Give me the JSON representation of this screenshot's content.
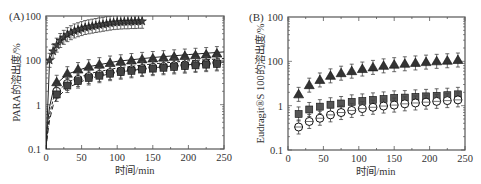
{
  "chart_data": [
    {
      "panel": "(A)",
      "type": "scatter",
      "title": "",
      "xlabel": "时间/min",
      "ylabel": "PARA的溶出度/%",
      "xlim": [
        0,
        250
      ],
      "ylim": [
        0.1,
        100
      ],
      "yscale": "log",
      "xticks": [
        0,
        50,
        100,
        150,
        200,
        250
      ],
      "xtick_labels": [
        "0",
        "50",
        "100",
        "150",
        "200",
        "250"
      ],
      "yticks": [
        0.1,
        1,
        10,
        100
      ],
      "ytick_labels": [
        "0.1",
        "1",
        "100",
        "100"
      ],
      "grid": false,
      "legend": null,
      "series": [
        {
          "name": "stars",
          "marker": "star",
          "fill": "#444444",
          "x": [
            5,
            10,
            15,
            20,
            25,
            30,
            35,
            40,
            45,
            50,
            55,
            60,
            65,
            70,
            75,
            80,
            85,
            90,
            95,
            100,
            105,
            110,
            115,
            120,
            125,
            130,
            135
          ],
          "values": [
            10,
            16,
            22,
            28,
            33,
            38,
            42,
            46,
            49,
            52,
            55,
            57,
            59,
            61,
            63,
            65,
            67,
            69,
            71,
            72,
            73,
            74,
            74,
            75,
            75,
            76,
            76
          ],
          "line": {
            "style": "solid",
            "x": [
              0,
              5,
              10,
              20,
              30,
              40,
              50,
              60,
              70,
              80,
              90,
              100,
              110,
              120,
              135
            ],
            "values": [
              0.1,
              10,
              16,
              28,
              38,
              46,
              52,
              57,
              61,
              65,
              69,
              72,
              74,
              75,
              76
            ]
          }
        },
        {
          "name": "triangles",
          "marker": "triangle",
          "fill": "#333333",
          "x": [
            15,
            30,
            45,
            60,
            75,
            90,
            105,
            120,
            135,
            150,
            165,
            180,
            195,
            210,
            225,
            240
          ],
          "values": [
            3.2,
            5.0,
            6.2,
            7.2,
            8.0,
            8.7,
            9.3,
            9.9,
            10.5,
            11.0,
            11.5,
            12.0,
            12.5,
            13.0,
            13.5,
            14.2
          ]
        },
        {
          "name": "circles",
          "marker": "circle",
          "fill": "#ffffff",
          "x": [
            15,
            30,
            45,
            60,
            75,
            90,
            105,
            120,
            135,
            150,
            165,
            180,
            195,
            210,
            225,
            240
          ],
          "values": [
            2.0,
            3.0,
            3.7,
            4.3,
            4.8,
            5.3,
            5.7,
            6.1,
            6.5,
            6.9,
            7.2,
            7.5,
            7.8,
            8.1,
            8.4,
            8.7
          ]
        },
        {
          "name": "squares",
          "marker": "square",
          "fill": "#444444",
          "x": [
            15,
            30,
            45,
            60,
            75,
            90,
            105,
            120,
            135,
            150,
            165,
            180,
            195,
            210,
            225,
            240
          ],
          "values": [
            1.7,
            2.7,
            3.4,
            4.0,
            4.5,
            5.0,
            5.4,
            5.8,
            6.2,
            6.5,
            6.8,
            7.1,
            7.4,
            7.7,
            8.0,
            8.3
          ]
        }
      ],
      "fit_lines": [
        {
          "name": "fit-solid",
          "style": "solid",
          "x": [
            0,
            2,
            5,
            10,
            15,
            30,
            60,
            100,
            150,
            200,
            250
          ],
          "values": [
            0.1,
            0.35,
            0.9,
            2.0,
            3.0,
            4.9,
            7.2,
            9.5,
            11.6,
            13.5,
            15.5
          ]
        },
        {
          "name": "fit-short-dash",
          "style": "short-dash",
          "x": [
            0,
            2,
            5,
            10,
            15,
            30,
            60,
            100,
            150,
            200,
            250
          ],
          "values": [
            0.1,
            0.25,
            0.6,
            1.3,
            1.9,
            3.2,
            5.0,
            6.7,
            8.3,
            9.7,
            11.0
          ]
        },
        {
          "name": "fit-long-dash",
          "style": "long-dash",
          "x": [
            0,
            2,
            5,
            10,
            15,
            30,
            60,
            100,
            150,
            200,
            250
          ],
          "values": [
            0.1,
            0.2,
            0.45,
            0.95,
            1.4,
            2.4,
            3.9,
            5.4,
            6.8,
            8.0,
            9.2
          ]
        }
      ]
    },
    {
      "panel": "(B)",
      "type": "scatter",
      "title": "",
      "xlabel": "时间/min",
      "ylabel": "Eudragit®S 100的溶出度/%",
      "xlim": [
        0,
        250
      ],
      "ylim": [
        0.1,
        100
      ],
      "yscale": "log",
      "xticks": [
        0,
        50,
        100,
        150,
        200,
        250
      ],
      "xtick_labels": [
        "0",
        "50",
        "100",
        "150",
        "200",
        "250"
      ],
      "yticks": [
        0.1,
        1,
        10,
        100
      ],
      "ytick_labels": [
        "0.1",
        "1",
        "100",
        "100"
      ],
      "grid": false,
      "legend": null,
      "series": [
        {
          "name": "triangles",
          "marker": "triangle",
          "fill": "#333333",
          "x": [
            15,
            30,
            45,
            60,
            75,
            90,
            105,
            120,
            135,
            150,
            165,
            180,
            195,
            210,
            225,
            240
          ],
          "values": [
            1.8,
            2.9,
            3.8,
            4.7,
            5.4,
            6.0,
            6.7,
            7.3,
            7.9,
            8.4,
            8.8,
            9.2,
            9.6,
            10.0,
            10.3,
            10.7
          ]
        },
        {
          "name": "squares",
          "marker": "square",
          "fill": "#555555",
          "error": true,
          "x": [
            15,
            30,
            45,
            60,
            75,
            90,
            105,
            120,
            135,
            150,
            165,
            180,
            195,
            210,
            225,
            240
          ],
          "values": [
            0.65,
            0.82,
            0.95,
            1.05,
            1.12,
            1.22,
            1.28,
            1.35,
            1.42,
            1.5,
            1.52,
            1.58,
            1.62,
            1.67,
            1.72,
            1.8
          ]
        },
        {
          "name": "circles",
          "marker": "circle",
          "fill": "#ffffff",
          "x": [
            15,
            30,
            45,
            60,
            75,
            90,
            105,
            120,
            135,
            150,
            165,
            180,
            195,
            210,
            225,
            240
          ],
          "values": [
            0.33,
            0.44,
            0.52,
            0.62,
            0.7,
            0.78,
            0.86,
            0.92,
            0.98,
            1.03,
            1.1,
            1.15,
            1.2,
            1.25,
            1.3,
            1.35
          ]
        }
      ],
      "fit_lines": []
    }
  ],
  "colors": {
    "axis": "#555555",
    "text": "#333333",
    "marker_dark": "#333333",
    "marker_mid": "#555555"
  }
}
